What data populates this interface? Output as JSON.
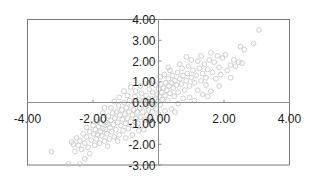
{
  "chart_data": {
    "type": "scatter",
    "title": "",
    "xlabel": "",
    "ylabel": "",
    "xlim": [
      -4.0,
      4.0
    ],
    "ylim": [
      -3.0,
      4.0
    ],
    "x_ticks": [
      "-4.00",
      "-2.00",
      "0.00",
      "2.00",
      "4.00"
    ],
    "y_ticks": [
      "4.00",
      "3.00",
      "2.00",
      "1.00",
      "0.00",
      "-1.00",
      "-2.00",
      "-3.00"
    ],
    "grid": false,
    "legend": null,
    "marker": {
      "shape": "hollow-circle",
      "color": "#c8c8c8",
      "radius": 2.4
    },
    "axis_color": "#8c8c8c",
    "frame_color": "#7a7a7a",
    "series": [
      {
        "name": "series-1",
        "points": [
          [
            3.07,
            3.5
          ],
          [
            2.9,
            2.85
          ],
          [
            2.5,
            2.7
          ],
          [
            2.62,
            2.55
          ],
          [
            2.45,
            1.95
          ],
          [
            2.3,
            2.05
          ],
          [
            2.2,
            1.8
          ],
          [
            2.05,
            2.3
          ],
          [
            1.95,
            2.15
          ],
          [
            1.85,
            1.7
          ],
          [
            1.8,
            2.25
          ],
          [
            1.7,
            1.95
          ],
          [
            1.65,
            1.45
          ],
          [
            1.55,
            2.05
          ],
          [
            1.5,
            1.6
          ],
          [
            1.45,
            1.2
          ],
          [
            1.4,
            1.85
          ],
          [
            1.35,
            1.4
          ],
          [
            1.3,
            1.05
          ],
          [
            1.25,
            1.65
          ],
          [
            1.2,
            2.0
          ],
          [
            1.15,
            1.3
          ],
          [
            1.1,
            0.95
          ],
          [
            1.05,
            1.55
          ],
          [
            1.0,
            1.2
          ],
          [
            0.95,
            0.8
          ],
          [
            0.92,
            1.75
          ],
          [
            0.88,
            1.4
          ],
          [
            0.85,
            1.05
          ],
          [
            0.8,
            0.6
          ],
          [
            0.75,
            1.3
          ],
          [
            0.72,
            1.65
          ],
          [
            0.7,
            0.9
          ],
          [
            0.65,
            1.15
          ],
          [
            0.6,
            0.5
          ],
          [
            0.58,
            1.45
          ],
          [
            0.55,
            0.85
          ],
          [
            0.5,
            1.05
          ],
          [
            0.48,
            0.3
          ],
          [
            0.45,
            0.7
          ],
          [
            0.42,
            1.3
          ],
          [
            0.4,
            0.95
          ],
          [
            0.35,
            0.45
          ],
          [
            0.32,
            0.8
          ],
          [
            0.3,
            1.15
          ],
          [
            0.28,
            0.1
          ],
          [
            0.25,
            0.6
          ],
          [
            0.22,
            0.95
          ],
          [
            0.2,
            0.35
          ],
          [
            0.18,
            1.35
          ],
          [
            0.15,
            0.7
          ],
          [
            0.12,
            0.15
          ],
          [
            0.1,
            0.5
          ],
          [
            0.08,
            0.9
          ],
          [
            0.05,
            -0.1
          ],
          [
            0.03,
            0.3
          ],
          [
            0.0,
            0.65
          ],
          [
            -0.02,
            0.05
          ],
          [
            -0.05,
            0.4
          ],
          [
            -0.08,
            -0.3
          ],
          [
            -0.1,
            0.85
          ],
          [
            -0.12,
            0.15
          ],
          [
            -0.15,
            -0.15
          ],
          [
            -0.18,
            0.5
          ],
          [
            -0.2,
            -0.45
          ],
          [
            -0.22,
            0.2
          ],
          [
            -0.25,
            -0.05
          ],
          [
            -0.28,
            0.65
          ],
          [
            -0.3,
            -0.35
          ],
          [
            -0.33,
            0.05
          ],
          [
            -0.35,
            -0.6
          ],
          [
            -0.38,
            0.35
          ],
          [
            -0.4,
            -0.2
          ],
          [
            -0.42,
            -0.85
          ],
          [
            -0.45,
            0.1
          ],
          [
            -0.48,
            -0.45
          ],
          [
            -0.5,
            -0.1
          ],
          [
            -0.52,
            0.45
          ],
          [
            -0.55,
            -0.7
          ],
          [
            -0.58,
            -0.25
          ],
          [
            -0.6,
            0.15
          ],
          [
            -0.62,
            -1.0
          ],
          [
            -0.65,
            -0.45
          ],
          [
            -0.68,
            -0.05
          ],
          [
            -0.7,
            -0.75
          ],
          [
            -0.72,
            0.3
          ],
          [
            -0.75,
            -0.35
          ],
          [
            -0.78,
            -1.1
          ],
          [
            -0.8,
            -0.6
          ],
          [
            -0.82,
            -0.15
          ],
          [
            -0.85,
            -0.9
          ],
          [
            -0.88,
            0.1
          ],
          [
            -0.9,
            -0.45
          ],
          [
            -0.92,
            -1.25
          ],
          [
            -0.95,
            -0.75
          ],
          [
            -0.98,
            -0.25
          ],
          [
            -1.0,
            -1.0
          ],
          [
            -1.03,
            -0.55
          ],
          [
            -1.05,
            0.0
          ],
          [
            -1.08,
            -1.35
          ],
          [
            -1.1,
            -0.8
          ],
          [
            -1.12,
            -0.35
          ],
          [
            -1.15,
            -1.1
          ],
          [
            -1.18,
            -0.6
          ],
          [
            -1.2,
            -1.55
          ],
          [
            -1.22,
            -0.15
          ],
          [
            -1.25,
            -0.95
          ],
          [
            -1.28,
            -0.45
          ],
          [
            -1.3,
            -1.3
          ],
          [
            -1.33,
            -0.75
          ],
          [
            -1.35,
            -1.65
          ],
          [
            -1.38,
            -1.05
          ],
          [
            -1.4,
            -0.5
          ],
          [
            -1.43,
            -1.4
          ],
          [
            -1.45,
            -0.85
          ],
          [
            -1.48,
            -1.2
          ],
          [
            -1.5,
            -1.75
          ],
          [
            -1.53,
            -0.65
          ],
          [
            -1.55,
            -1.05
          ],
          [
            -1.58,
            -1.5
          ],
          [
            -1.6,
            -0.95
          ],
          [
            -1.63,
            -1.3
          ],
          [
            -1.65,
            -1.85
          ],
          [
            -1.68,
            -0.8
          ],
          [
            -1.7,
            -1.25
          ],
          [
            -1.73,
            -1.6
          ],
          [
            -1.75,
            -1.0
          ],
          [
            -1.78,
            -1.4
          ],
          [
            -1.8,
            -1.95
          ],
          [
            -1.83,
            -1.15
          ],
          [
            -1.85,
            -1.55
          ],
          [
            -1.88,
            -0.9
          ],
          [
            -1.9,
            -1.75
          ],
          [
            -1.93,
            -1.3
          ],
          [
            -1.95,
            -2.05
          ],
          [
            -1.98,
            -1.5
          ],
          [
            -2.0,
            -1.1
          ],
          [
            -2.05,
            -1.8
          ],
          [
            -2.1,
            -1.4
          ],
          [
            -2.15,
            -2.15
          ],
          [
            -2.2,
            -1.65
          ],
          [
            -2.25,
            -1.95
          ],
          [
            -2.3,
            -1.5
          ],
          [
            -2.35,
            -2.25
          ],
          [
            -2.4,
            -1.85
          ],
          [
            -2.45,
            -2.05
          ],
          [
            -2.5,
            -1.7
          ],
          [
            -2.55,
            -2.35
          ],
          [
            -2.6,
            -2.0
          ],
          [
            -2.65,
            -1.9
          ],
          [
            -2.4,
            -2.95
          ],
          [
            -2.75,
            -2.95
          ],
          [
            -3.27,
            -2.36
          ],
          [
            -2.25,
            -2.7
          ],
          [
            -2.1,
            -2.45
          ],
          [
            0.95,
            0.25
          ],
          [
            1.2,
            0.6
          ],
          [
            1.45,
            0.85
          ],
          [
            1.6,
            0.55
          ],
          [
            1.75,
            1.15
          ],
          [
            1.9,
            1.35
          ],
          [
            2.1,
            1.55
          ],
          [
            2.35,
            1.75
          ],
          [
            2.55,
            1.9
          ],
          [
            1.35,
            0.4
          ],
          [
            0.6,
            -0.05
          ],
          [
            0.75,
            0.2
          ],
          [
            0.4,
            -0.3
          ],
          [
            0.2,
            -0.4
          ],
          [
            0.0,
            -0.55
          ],
          [
            -0.2,
            -0.8
          ],
          [
            -0.4,
            -1.05
          ],
          [
            -0.6,
            -1.35
          ],
          [
            -0.8,
            -1.55
          ],
          [
            -1.0,
            -1.7
          ],
          [
            -0.7,
            0.55
          ],
          [
            -0.95,
            0.35
          ],
          [
            -1.2,
            0.25
          ],
          [
            -1.45,
            -0.25
          ],
          [
            -1.7,
            -0.5
          ],
          [
            -0.3,
            0.95
          ],
          [
            0.05,
            1.25
          ],
          [
            0.35,
            1.55
          ],
          [
            0.65,
            1.85
          ],
          [
            1.0,
            2.05
          ],
          [
            1.3,
            2.25
          ],
          [
            1.6,
            2.4
          ],
          [
            -0.55,
            0.8
          ],
          [
            -1.05,
            0.55
          ],
          [
            -2.2,
            -1.2
          ],
          [
            -1.25,
            -1.85
          ],
          [
            -1.55,
            -2.1
          ],
          [
            -0.45,
            -1.3
          ],
          [
            0.15,
            -0.7
          ],
          [
            0.5,
            -0.45
          ],
          [
            1.1,
            0.1
          ],
          [
            1.5,
            0.3
          ],
          [
            1.85,
            0.8
          ],
          [
            2.2,
            1.2
          ],
          [
            0.85,
            2.2
          ],
          [
            0.3,
            1.7
          ],
          [
            -0.15,
            1.05
          ],
          [
            -0.85,
            0.75
          ],
          [
            -1.35,
            0.05
          ],
          [
            -1.65,
            -0.25
          ]
        ]
      }
    ]
  }
}
